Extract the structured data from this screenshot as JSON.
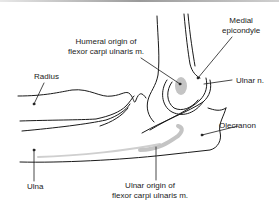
{
  "figure": {
    "labels": [
      {
        "id": "humeral-origin",
        "lines": [
          "Humeral origin of",
          "flexor carpi ulnaris m."
        ]
      },
      {
        "id": "medial-epicondyle",
        "lines": [
          "Medial",
          "epicondyle"
        ]
      },
      {
        "id": "radius",
        "lines": [
          "Radius"
        ]
      },
      {
        "id": "ulnar-nerve",
        "lines": [
          "Ulnar n."
        ]
      },
      {
        "id": "olecranon",
        "lines": [
          "Olecranon"
        ]
      },
      {
        "id": "ulna",
        "lines": [
          "Ulna"
        ]
      },
      {
        "id": "ulnar-origin",
        "lines": [
          "Ulnar origin of",
          "flexor carpi ulnaris m."
        ]
      }
    ],
    "colors": {
      "line": "#1a1a1a",
      "shading": "#c4c4c4",
      "background": "#ffffff"
    }
  }
}
